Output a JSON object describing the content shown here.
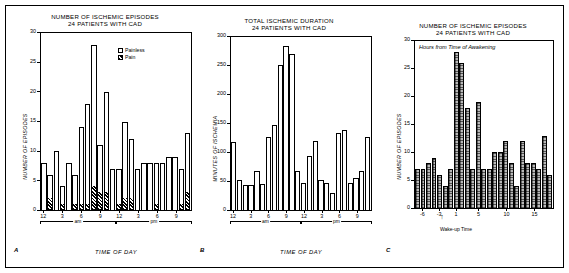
{
  "figure": {
    "panel_letters": [
      "A",
      "B",
      "C"
    ]
  },
  "chart_data": [
    {
      "type": "bar",
      "panel": "A",
      "title": "NUMBER OF ISCHEMIC EPISODES",
      "subtitle": "24 PATIENTS WITH CAD",
      "xlabel": "TIME OF DAY",
      "ylabel": "NUMBER OF EPISODES",
      "ylim": [
        0,
        30
      ],
      "yticks": [
        0,
        5,
        10,
        15,
        20,
        25,
        30
      ],
      "xtick_labels": [
        "12",
        "3",
        "6",
        "9",
        "12",
        "3",
        "6",
        "9"
      ],
      "xtick_positions": [
        0,
        3,
        6,
        9,
        12,
        15,
        18,
        21
      ],
      "period_labels": [
        "am",
        "pm"
      ],
      "grid": false,
      "legend": [
        "Painless",
        "Pain"
      ],
      "legend_position": "top-right",
      "categories": [
        "12am",
        "1am",
        "2am",
        "3am",
        "4am",
        "5am",
        "6am",
        "7am",
        "8am",
        "9am",
        "10am",
        "11am",
        "12pm",
        "1pm",
        "2pm",
        "3pm",
        "4pm",
        "5pm",
        "6pm",
        "7pm",
        "8pm",
        "9pm",
        "10pm",
        "11pm"
      ],
      "series": [
        {
          "name": "Painless",
          "values": [
            8,
            4,
            10,
            3,
            8,
            5,
            13,
            17,
            24,
            8,
            17,
            7,
            6,
            13,
            10,
            7,
            8,
            8,
            7,
            8,
            9,
            9,
            6,
            10
          ]
        },
        {
          "name": "Pain",
          "values": [
            0,
            2,
            0,
            1,
            0,
            1,
            1,
            1,
            4,
            3,
            3,
            0,
            1,
            2,
            2,
            0,
            0,
            0,
            1,
            0,
            0,
            0,
            1,
            3
          ]
        }
      ],
      "totals": [
        8,
        6,
        10,
        4,
        8,
        6,
        14,
        18,
        28,
        11,
        20,
        7,
        7,
        15,
        12,
        7,
        8,
        8,
        8,
        8,
        9,
        9,
        7,
        13
      ]
    },
    {
      "type": "bar",
      "panel": "B",
      "title": "TOTAL ISCHEMIC DURATION",
      "subtitle": "24 PATIENTS WITH CAD",
      "xlabel": "TIME OF DAY",
      "ylabel": "MINUTES OF ISCHEMIA",
      "ylim": [
        0,
        300
      ],
      "yticks": [
        0,
        50,
        100,
        150,
        200,
        250,
        300
      ],
      "xtick_labels": [
        "12",
        "3",
        "6",
        "9",
        "12",
        "3",
        "6",
        "9"
      ],
      "xtick_positions": [
        0,
        3,
        6,
        9,
        12,
        15,
        18,
        21
      ],
      "period_labels": [
        "am",
        "pm"
      ],
      "grid": false,
      "categories": [
        "12am",
        "1am",
        "2am",
        "3am",
        "4am",
        "5am",
        "6am",
        "7am",
        "8am",
        "9am",
        "10am",
        "11am",
        "12pm",
        "1pm",
        "2pm",
        "3pm",
        "4pm",
        "5pm",
        "6pm",
        "7pm",
        "8pm",
        "9pm",
        "10pm",
        "11pm"
      ],
      "values": [
        118,
        52,
        44,
        43,
        67,
        45,
        127,
        148,
        252,
        284,
        271,
        68,
        47,
        93,
        119,
        52,
        46,
        29,
        133,
        138,
        46,
        55,
        68,
        126
      ]
    },
    {
      "type": "bar",
      "panel": "C",
      "title": "NUMBER OF ISCHEMIC EPISODES",
      "subtitle": "24 PATIENTS WITH CAD",
      "annotation": "Hours from Time of Awakening",
      "xlabel": "Wake-up Time",
      "ylabel": "NUMBER OF EPISODES",
      "ylim": [
        0,
        30
      ],
      "yticks": [
        0,
        5,
        10,
        15,
        20,
        25,
        30
      ],
      "xtick_labels": [
        "-6",
        "-3",
        "1",
        "5",
        "10",
        "15"
      ],
      "xtick_values": [
        -6,
        -3,
        1,
        5,
        10,
        15
      ],
      "grid": false,
      "x": [
        -7,
        -6,
        -5,
        -4,
        -3,
        -2,
        -1,
        1,
        2,
        3,
        4,
        5,
        6,
        7,
        8,
        9,
        10,
        11,
        12,
        13,
        14,
        15,
        16,
        17
      ],
      "values": [
        7,
        7,
        8,
        9,
        6,
        4,
        7,
        28,
        26,
        18,
        7,
        19,
        7,
        7,
        10,
        10,
        12,
        8,
        4,
        12,
        8,
        8,
        7,
        13,
        6
      ]
    }
  ]
}
